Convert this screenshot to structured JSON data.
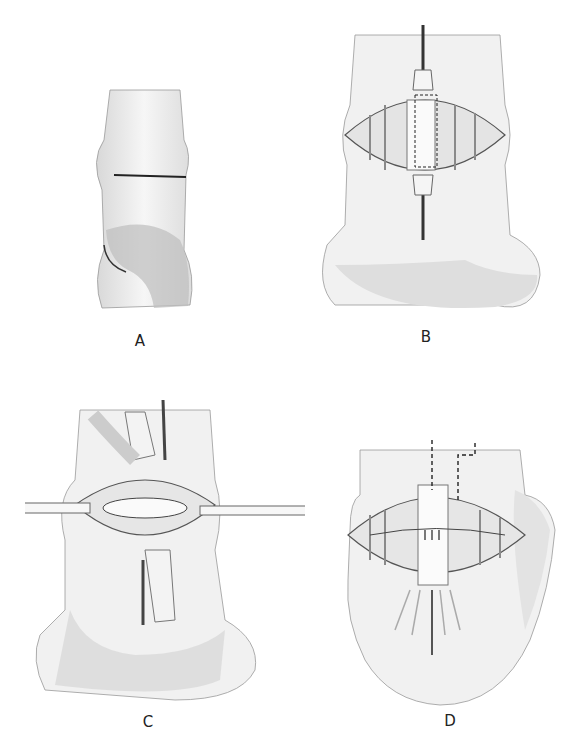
{
  "figure": {
    "panels": [
      {
        "id": "A",
        "label": "A",
        "description": "Posterior view of heel with transverse incision line"
      },
      {
        "id": "B",
        "label": "B",
        "description": "Incision opened with retracted tendon and dashed rectangular graft outline"
      },
      {
        "id": "C",
        "label": "C",
        "description": "Tendon divided and reflected, instruments across exposed joint"
      },
      {
        "id": "D",
        "label": "D",
        "description": "Tendon repaired with sutures, dashed incision lines above"
      }
    ],
    "colors": {
      "background": "#ffffff",
      "skin": "#f2f2f2",
      "shade": "#cfcfcf",
      "line": "#333333"
    }
  }
}
